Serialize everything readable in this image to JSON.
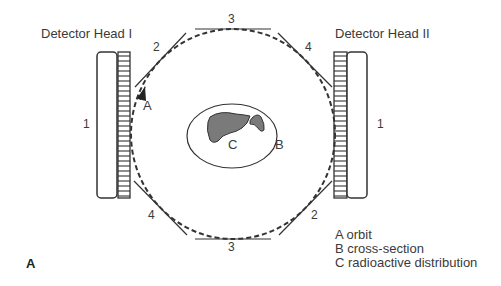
{
  "diagram": {
    "panel_label": "A",
    "detector_heads": [
      {
        "label": "Detector Head I",
        "head_number": "1"
      },
      {
        "label": "Detector Head II",
        "head_number": "1"
      }
    ],
    "collimator_edge_labels": {
      "top": "3",
      "bottom": "3",
      "top_left": "2",
      "bottom_right": "2",
      "top_right": "4",
      "bottom_left": "4"
    },
    "markers": {
      "orbit": "A",
      "cross_section": "B",
      "radioactive_distribution": "C"
    },
    "legend": [
      {
        "key": "A",
        "text": "A orbit"
      },
      {
        "key": "B",
        "text": "B cross-section"
      },
      {
        "key": "C",
        "text": "C radioactive distribution"
      }
    ],
    "colors": {
      "line": "#333333",
      "organ_fill": "#7a7a7a",
      "background": "#ffffff"
    }
  }
}
